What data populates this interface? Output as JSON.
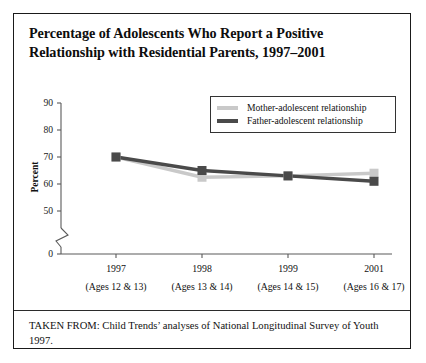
{
  "figure": {
    "title": "Percentage of Adolescents Who Report a Positive Relationship with Residential Parents, 1997–2001",
    "caption": "TAKEN FROM: Child Trends’ analyses of National Longitudinal Survey of Youth 1997."
  },
  "colors": {
    "mother": "#c9c9c9",
    "father": "#4a4a4a",
    "axis": "#5a5a5a",
    "border": "#1a1a1a",
    "text": "#111111"
  },
  "chart_data": {
    "type": "line",
    "title": "Percentage of Adolescents Who Report a Positive Relationship with Residential Parents, 1997–2001",
    "xlabel": "",
    "ylabel": "Percent",
    "ylim": [
      0,
      90
    ],
    "y_ticks": [
      "0",
      "50",
      "60",
      "70",
      "80",
      "90"
    ],
    "y_axis_break": true,
    "grid": false,
    "legend_position": "top-right",
    "categories": [
      "1997",
      "1998",
      "1999",
      "2001"
    ],
    "category_sublabels": [
      "(Ages 12 & 13)",
      "(Ages 13 & 14)",
      "(Ages 14 & 15)",
      "(Ages 16 & 17)"
    ],
    "series": [
      {
        "name": "Mother-adolescent relationship",
        "color": "#c9c9c9",
        "values": [
          70,
          62.5,
          63,
          64
        ]
      },
      {
        "name": "Father-adolescent relationship",
        "color": "#4a4a4a",
        "values": [
          70,
          65,
          63,
          61
        ]
      }
    ]
  }
}
